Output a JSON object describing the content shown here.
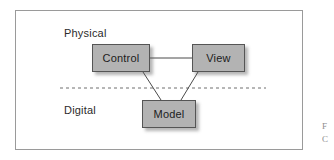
{
  "figure": {
    "regions": [
      {
        "id": "physical",
        "label": "Physical"
      },
      {
        "id": "digital",
        "label": "Digital"
      }
    ],
    "nodes": [
      {
        "id": "control",
        "label": "Control"
      },
      {
        "id": "view",
        "label": "View"
      },
      {
        "id": "model",
        "label": "Model"
      }
    ],
    "connectors": [
      {
        "from": "control",
        "to": "view",
        "style": "solid"
      },
      {
        "from": "control",
        "to": "model",
        "style": "solid"
      },
      {
        "from": "view",
        "to": "model",
        "style": "solid"
      }
    ],
    "divider": {
      "style": "dashed",
      "separates": [
        "Physical",
        "Digital"
      ]
    },
    "caption_fragment": {
      "line1": "F",
      "line2": "C"
    }
  },
  "colors": {
    "node_fill": "#b3b3b3",
    "node_border": "#555555",
    "frame_border": "#9a9a9a",
    "connector": "#4a4a4a",
    "divider": "#6e6e6e",
    "text": "#2b2b2b",
    "background": "#ffffff"
  }
}
